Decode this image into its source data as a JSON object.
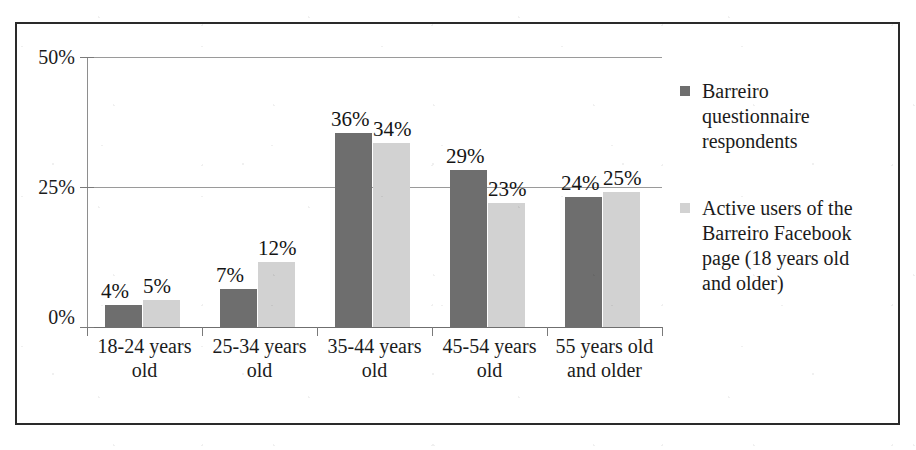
{
  "chart_data": {
    "type": "bar",
    "title": "",
    "subtitle": "",
    "xlabel": "",
    "ylabel": "",
    "categories": [
      "18-24 years old",
      "25-34 years old",
      "35-44 years old",
      "45-54 years old",
      "55 years old and older"
    ],
    "category_lines": [
      [
        "18-24 years",
        "old"
      ],
      [
        "25-34 years",
        "old"
      ],
      [
        "35-44 years",
        "old"
      ],
      [
        "45-54 years",
        "old"
      ],
      [
        "55 years old",
        "and older"
      ]
    ],
    "series": [
      {
        "name": "Barreiro questionnaire respondents",
        "color": "#6e6e6e",
        "values": [
          4,
          7,
          36,
          29,
          24
        ],
        "labels": [
          "4%",
          "7%",
          "36%",
          "29%",
          "24%"
        ]
      },
      {
        "name": "Active users of the Barreiro Facebook page (18 years old and older)",
        "color": "#d2d2d2",
        "values": [
          5,
          12,
          34,
          23,
          25
        ],
        "labels": [
          "5%",
          "12%",
          "34%",
          "23%",
          "25%"
        ]
      }
    ],
    "ylim": [
      0,
      50
    ],
    "yticks": [
      0,
      25,
      50
    ],
    "ytick_labels": [
      "0%",
      "25%",
      "50%"
    ],
    "grid": true,
    "legend_position": "right"
  },
  "legend": {
    "entries": [
      {
        "swatch": "#6e6e6e",
        "lines": [
          "Barreiro",
          "questionnaire",
          "respondents"
        ],
        "text": "Barreiro questionnaire respondents"
      },
      {
        "swatch": "#d2d2d2",
        "lines": [
          "Active users of the",
          "Barreiro Facebook",
          "page (18 years old",
          "and older)"
        ],
        "text": "Active users of the Barreiro Facebook page (18 years old and older)"
      }
    ]
  },
  "colors": {
    "series_dark": "#6e6e6e",
    "series_light": "#d2d2d2",
    "frame": "#2a2a2a",
    "gridline": "#9a9a9a",
    "text": "#1b1b1b",
    "background": "#ffffff"
  }
}
